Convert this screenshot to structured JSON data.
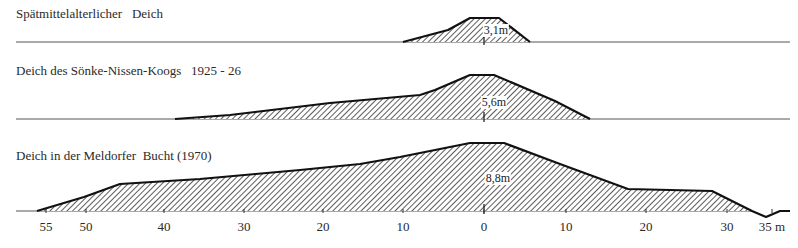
{
  "profiles": [
    {
      "title": "Spätmittelalterlicher   Deich",
      "height_label": "3,1m",
      "ground_y": 42,
      "polygon": "403,42 448,30 470,18 499,18 530,42",
      "crest_outline": "403,42 448,30 470,18 499,18 530,42",
      "label_x": 496,
      "label_y": 24
    },
    {
      "title": "Deich des Sönke-Nissen-Koogs   1925 - 26",
      "height_label": "5,6m",
      "ground_y": 119,
      "polygon": "175,119 230,115 330,103 420,95 435,90 470,75 494,75 555,101 590,119",
      "crest_outline": "175,119 230,115 330,103 420,95 435,90 470,75 494,75 555,101 590,119",
      "label_x": 494,
      "label_y": 96
    },
    {
      "title": "Deich in der Meldorfer  Bucht (1970)",
      "height_label": "8,8m",
      "ground_y": 211,
      "polygon": "37,211 84,197 120,184 200,179 300,170 360,164 400,157 470,143 504,143 560,164 628,189 712,191 752,211",
      "crest_outline": "37,211 84,197 120,184 200,179 300,170 360,164 400,157 470,143 504,143 560,164 628,189 712,191 752,211 766,217 780,211 790,211",
      "label_x": 498,
      "label_y": 172
    }
  ],
  "axis": {
    "unit": "m",
    "ticks": [
      {
        "label": "55",
        "x": 46
      },
      {
        "label": "50",
        "x": 86
      },
      {
        "label": "40",
        "x": 164
      },
      {
        "label": "30",
        "x": 244
      },
      {
        "label": "20",
        "x": 323
      },
      {
        "label": "10",
        "x": 403
      },
      {
        "label": "0",
        "x": 484
      },
      {
        "label": "10",
        "x": 566
      },
      {
        "label": "20",
        "x": 646
      },
      {
        "label": "30",
        "x": 727
      },
      {
        "label": "35 m",
        "x": 772
      }
    ]
  }
}
